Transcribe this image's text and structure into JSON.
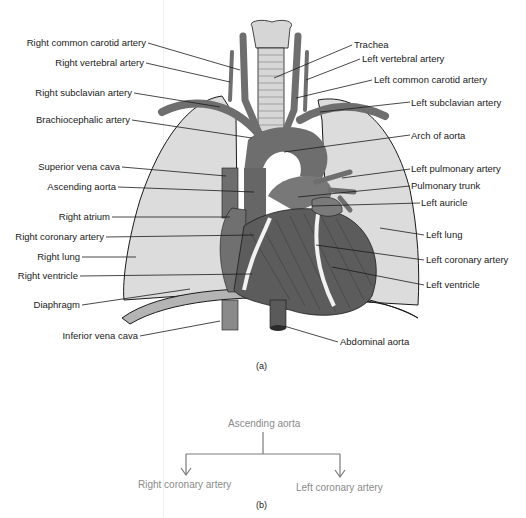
{
  "figure": {
    "panel_a_label": "(a)",
    "panel_b_label": "(b)",
    "caption_partial": "FIGURE 14.3  Ascending aorta and its branches"
  },
  "colors": {
    "vessel": "#6e6e6e",
    "heart_dark": "#5c5c5c",
    "lung": "#dcdcdc",
    "trachea": "#cfcfcf",
    "outline": "#1a1a1a",
    "flow_text": "#8a8a8a",
    "flow_line": "#7a7a7a"
  },
  "labels_left": [
    {
      "text": "Right common carotid artery",
      "y": 42
    },
    {
      "text": "Right vertebral artery",
      "y": 62
    },
    {
      "text": "Right subclavian artery",
      "y": 92
    },
    {
      "text": "Brachiocephalic artery",
      "y": 119
    },
    {
      "text": "Superior vena cava",
      "y": 166
    },
    {
      "text": "Ascending aorta",
      "y": 186
    },
    {
      "text": "Right atrium",
      "y": 216
    },
    {
      "text": "Right coronary artery",
      "y": 236
    },
    {
      "text": "Right lung",
      "y": 256
    },
    {
      "text": "Right ventricle",
      "y": 275
    },
    {
      "text": "Diaphragm",
      "y": 304
    },
    {
      "text": "Inferior vena cava",
      "y": 335
    }
  ],
  "labels_right": [
    {
      "text": "Trachea",
      "y": 44
    },
    {
      "text": "Left vertebral artery",
      "y": 58
    },
    {
      "text": "Left common carotid artery",
      "y": 79
    },
    {
      "text": "Left subclavian artery",
      "y": 102
    },
    {
      "text": "Arch of aorta",
      "y": 135
    },
    {
      "text": "Left pulmonary artery",
      "y": 168
    },
    {
      "text": "Pulmonary trunk",
      "y": 185
    },
    {
      "text": "Left auricle",
      "y": 202
    },
    {
      "text": "Left lung",
      "y": 234
    },
    {
      "text": "Left coronary artery",
      "y": 259
    },
    {
      "text": "Left ventricle",
      "y": 284
    },
    {
      "text": "Abdominal aorta",
      "y": 341
    }
  ],
  "flowchart": {
    "root": "Ascending aorta",
    "children": [
      "Right coronary artery",
      "Left coronary artery"
    ]
  }
}
